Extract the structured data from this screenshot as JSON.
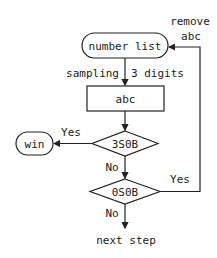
{
  "diagram": {
    "type": "flowchart",
    "nodes": {
      "start": {
        "label": "number list",
        "shape": "rounded"
      },
      "sample": {
        "label": "abc",
        "shape": "rect"
      },
      "check1": {
        "label": "3S0B",
        "shape": "diamond"
      },
      "win": {
        "label": "win",
        "shape": "rounded"
      },
      "check2": {
        "label": "0S0B",
        "shape": "diamond"
      },
      "end": {
        "label": "next step",
        "shape": "text"
      }
    },
    "edges": {
      "sampling_left": "sampling",
      "sampling_right": "3 digits",
      "check1_yes": "Yes",
      "check1_no": "No",
      "check2_yes": "Yes",
      "check2_no": "No",
      "feedback_line1": "remove",
      "feedback_line2": "abc"
    },
    "colors": {
      "stroke": "#222222",
      "background": "#ffffff"
    }
  }
}
